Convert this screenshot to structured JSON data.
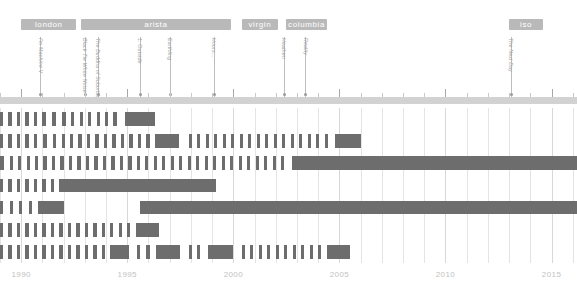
{
  "chart_data": {
    "type": "timeline",
    "title": "",
    "xlabel": "",
    "ylabel": "",
    "xlim": [
      1989.0,
      2016.2
    ],
    "grid": true,
    "axis": {
      "year_ticks": [
        1990,
        1995,
        2000,
        2005,
        2010,
        2015
      ],
      "minor_tick_step": 1,
      "tick_labels": [
        "1990",
        "1995",
        "2000",
        "2005",
        "2010",
        "2015"
      ]
    },
    "eras": [
      {
        "name": "london",
        "start": 1990.0,
        "end": 1992.6
      },
      {
        "name": "arista",
        "start": 1992.8,
        "end": 1999.9
      },
      {
        "name": "virgin",
        "start": 2000.4,
        "end": 2002.1
      },
      {
        "name": "columbia",
        "start": 2002.5,
        "end": 2004.4
      },
      {
        "name": "iso",
        "start": 2013.0,
        "end": 2014.6
      }
    ],
    "markers": [
      {
        "label": "I'm Machine V",
        "year": 1990.9,
        "elbow": false
      },
      {
        "label": "Black Tie White Noise",
        "year": 1993.0,
        "elbow": true
      },
      {
        "label": "The Buddha of Suburbia",
        "year": 1993.6,
        "elbow": true
      },
      {
        "label": "1. Outside",
        "year": 1995.6,
        "elbow": false
      },
      {
        "label": "Earthling",
        "year": 1997.0,
        "elbow": false
      },
      {
        "label": "Hours...",
        "year": 1999.1,
        "elbow": false
      },
      {
        "label": "Heathen",
        "year": 2002.4,
        "elbow": false
      },
      {
        "label": "Reality",
        "year": 2003.4,
        "elbow": false
      },
      {
        "label": "The Next Day",
        "year": 2013.1,
        "elbow": false
      }
    ],
    "rows": [
      {
        "name": "row-1",
        "title": "",
        "segments": [
          {
            "start": 1989.0,
            "end": 1989.15
          },
          {
            "start": 1989.4,
            "end": 1989.55
          },
          {
            "start": 1989.8,
            "end": 1989.95
          },
          {
            "start": 1990.2,
            "end": 1990.35
          },
          {
            "start": 1990.6,
            "end": 1990.75
          },
          {
            "start": 1991.0,
            "end": 1991.15
          },
          {
            "start": 1991.45,
            "end": 1991.62
          },
          {
            "start": 1991.9,
            "end": 1992.1
          },
          {
            "start": 1992.35,
            "end": 1992.5
          },
          {
            "start": 1992.75,
            "end": 1992.9
          },
          {
            "start": 1993.15,
            "end": 1993.3
          },
          {
            "start": 1993.55,
            "end": 1993.7
          },
          {
            "start": 1993.95,
            "end": 1994.1
          },
          {
            "start": 1994.35,
            "end": 1994.5
          },
          {
            "start": 1994.9,
            "end": 1996.3
          }
        ]
      },
      {
        "name": "row-2",
        "title": "",
        "segments": [
          {
            "start": 1989.0,
            "end": 1989.15
          },
          {
            "start": 1989.4,
            "end": 1989.55
          },
          {
            "start": 1989.8,
            "end": 1989.95
          },
          {
            "start": 1990.2,
            "end": 1990.35
          },
          {
            "start": 1990.6,
            "end": 1990.75
          },
          {
            "start": 1991.05,
            "end": 1991.2
          },
          {
            "start": 1991.5,
            "end": 1991.65
          },
          {
            "start": 1991.9,
            "end": 1992.05
          },
          {
            "start": 1992.3,
            "end": 1992.45
          },
          {
            "start": 1992.7,
            "end": 1992.85
          },
          {
            "start": 1993.1,
            "end": 1993.25
          },
          {
            "start": 1993.5,
            "end": 1993.65
          },
          {
            "start": 1993.9,
            "end": 1994.05
          },
          {
            "start": 1994.3,
            "end": 1994.45
          },
          {
            "start": 1994.7,
            "end": 1994.85
          },
          {
            "start": 1995.1,
            "end": 1995.25
          },
          {
            "start": 1995.5,
            "end": 1995.65
          },
          {
            "start": 1995.9,
            "end": 1996.05
          },
          {
            "start": 1996.3,
            "end": 1997.45
          },
          {
            "start": 1997.9,
            "end": 1998.05
          },
          {
            "start": 1998.3,
            "end": 1998.45
          },
          {
            "start": 1998.7,
            "end": 1998.85
          },
          {
            "start": 1999.1,
            "end": 1999.25
          },
          {
            "start": 1999.5,
            "end": 1999.65
          },
          {
            "start": 1999.9,
            "end": 2000.05
          },
          {
            "start": 2000.3,
            "end": 2000.45
          },
          {
            "start": 2000.7,
            "end": 2000.85
          },
          {
            "start": 2001.1,
            "end": 2001.25
          },
          {
            "start": 2001.5,
            "end": 2001.65
          },
          {
            "start": 2001.9,
            "end": 2002.05
          },
          {
            "start": 2002.3,
            "end": 2002.45
          },
          {
            "start": 2002.7,
            "end": 2002.85
          },
          {
            "start": 2003.1,
            "end": 2003.25
          },
          {
            "start": 2003.5,
            "end": 2003.65
          },
          {
            "start": 2003.9,
            "end": 2004.05
          },
          {
            "start": 2004.3,
            "end": 2004.45
          },
          {
            "start": 2004.8,
            "end": 2006.0
          }
        ]
      },
      {
        "name": "row-3",
        "title": "",
        "segments": [
          {
            "start": 1989.0,
            "end": 1989.2
          },
          {
            "start": 1989.45,
            "end": 1989.6
          },
          {
            "start": 1989.85,
            "end": 1990.0
          },
          {
            "start": 1990.25,
            "end": 1990.4
          },
          {
            "start": 1990.65,
            "end": 1990.8
          },
          {
            "start": 1991.05,
            "end": 1991.2
          },
          {
            "start": 1991.45,
            "end": 1991.6
          },
          {
            "start": 1991.85,
            "end": 1992.0
          },
          {
            "start": 1992.25,
            "end": 1992.4
          },
          {
            "start": 1992.65,
            "end": 1992.8
          },
          {
            "start": 1993.05,
            "end": 1993.2
          },
          {
            "start": 1993.45,
            "end": 1993.6
          },
          {
            "start": 1993.85,
            "end": 1994.0
          },
          {
            "start": 1994.25,
            "end": 1994.4
          },
          {
            "start": 1994.65,
            "end": 1994.8
          },
          {
            "start": 1995.05,
            "end": 1995.2
          },
          {
            "start": 1995.45,
            "end": 1995.6
          },
          {
            "start": 1995.85,
            "end": 1996.0
          },
          {
            "start": 1996.25,
            "end": 1996.4
          },
          {
            "start": 1996.65,
            "end": 1996.8
          },
          {
            "start": 1997.05,
            "end": 1997.2
          },
          {
            "start": 1997.45,
            "end": 1997.6
          },
          {
            "start": 1997.85,
            "end": 1998.0
          },
          {
            "start": 1998.25,
            "end": 1998.4
          },
          {
            "start": 1998.65,
            "end": 1998.8
          },
          {
            "start": 1999.05,
            "end": 1999.2
          },
          {
            "start": 1999.45,
            "end": 1999.6
          },
          {
            "start": 1999.85,
            "end": 2000.0
          },
          {
            "start": 2000.25,
            "end": 2000.4
          },
          {
            "start": 2000.65,
            "end": 2000.8
          },
          {
            "start": 2001.05,
            "end": 2001.2
          },
          {
            "start": 2001.45,
            "end": 2001.6
          },
          {
            "start": 2001.85,
            "end": 2002.0
          },
          {
            "start": 2002.25,
            "end": 2002.4
          },
          {
            "start": 2002.75,
            "end": 2016.2
          }
        ]
      },
      {
        "name": "row-4",
        "title": "",
        "segments": [
          {
            "start": 1989.0,
            "end": 1989.15
          },
          {
            "start": 1989.4,
            "end": 1989.55
          },
          {
            "start": 1989.8,
            "end": 1989.95
          },
          {
            "start": 1990.2,
            "end": 1990.35
          },
          {
            "start": 1990.6,
            "end": 1990.75
          },
          {
            "start": 1991.0,
            "end": 1991.15
          },
          {
            "start": 1991.4,
            "end": 1991.55
          },
          {
            "start": 1991.8,
            "end": 1999.2
          }
        ]
      },
      {
        "name": "row-5-dorsey",
        "title": "Dorsey",
        "segments": [
          {
            "start": 1989.0,
            "end": 1989.15
          },
          {
            "start": 1989.45,
            "end": 1989.6
          },
          {
            "start": 1989.9,
            "end": 1990.05
          },
          {
            "start": 1990.35,
            "end": 1990.5
          },
          {
            "start": 1990.8,
            "end": 1992.0
          },
          {
            "start": 1995.6,
            "end": 2016.2
          }
        ]
      },
      {
        "name": "row-6",
        "title": "",
        "segments": [
          {
            "start": 1989.0,
            "end": 1989.15
          },
          {
            "start": 1989.4,
            "end": 1989.55
          },
          {
            "start": 1989.8,
            "end": 1989.95
          },
          {
            "start": 1990.2,
            "end": 1990.35
          },
          {
            "start": 1990.6,
            "end": 1990.75
          },
          {
            "start": 1991.0,
            "end": 1991.15
          },
          {
            "start": 1991.4,
            "end": 1991.55
          },
          {
            "start": 1991.8,
            "end": 1991.95
          },
          {
            "start": 1992.2,
            "end": 1992.35
          },
          {
            "start": 1992.6,
            "end": 1992.75
          },
          {
            "start": 1993.0,
            "end": 1993.15
          },
          {
            "start": 1993.4,
            "end": 1993.55
          },
          {
            "start": 1993.8,
            "end": 1993.95
          },
          {
            "start": 1994.2,
            "end": 1994.35
          },
          {
            "start": 1994.6,
            "end": 1994.75
          },
          {
            "start": 1995.0,
            "end": 1995.15
          },
          {
            "start": 1995.4,
            "end": 1996.5
          }
        ]
      },
      {
        "name": "row-7",
        "title": "",
        "segments": [
          {
            "start": 1989.0,
            "end": 1989.15
          },
          {
            "start": 1989.4,
            "end": 1989.55
          },
          {
            "start": 1989.8,
            "end": 1989.95
          },
          {
            "start": 1990.2,
            "end": 1990.35
          },
          {
            "start": 1990.6,
            "end": 1990.75
          },
          {
            "start": 1991.0,
            "end": 1991.15
          },
          {
            "start": 1991.4,
            "end": 1991.55
          },
          {
            "start": 1991.8,
            "end": 1991.95
          },
          {
            "start": 1992.2,
            "end": 1992.35
          },
          {
            "start": 1992.6,
            "end": 1992.75
          },
          {
            "start": 1993.0,
            "end": 1993.15
          },
          {
            "start": 1993.4,
            "end": 1993.55
          },
          {
            "start": 1993.8,
            "end": 1993.95
          },
          {
            "start": 1994.2,
            "end": 1995.1
          },
          {
            "start": 1995.45,
            "end": 1995.6
          },
          {
            "start": 1995.9,
            "end": 1996.05
          },
          {
            "start": 1996.35,
            "end": 1997.5
          },
          {
            "start": 1997.9,
            "end": 1998.05
          },
          {
            "start": 1998.3,
            "end": 1998.45
          },
          {
            "start": 1998.8,
            "end": 2000.0
          },
          {
            "start": 2000.4,
            "end": 2000.55
          },
          {
            "start": 2000.8,
            "end": 2000.95
          },
          {
            "start": 2001.2,
            "end": 2001.35
          },
          {
            "start": 2001.6,
            "end": 2001.75
          },
          {
            "start": 2002.0,
            "end": 2002.15
          },
          {
            "start": 2002.4,
            "end": 2002.55
          },
          {
            "start": 2002.8,
            "end": 2002.95
          },
          {
            "start": 2003.2,
            "end": 2003.35
          },
          {
            "start": 2003.6,
            "end": 2003.75
          },
          {
            "start": 2004.0,
            "end": 2004.15
          },
          {
            "start": 2004.4,
            "end": 2005.5
          }
        ]
      }
    ],
    "colors": {
      "bar": "#6d6d6d",
      "era_band": "#b9b9b9",
      "era_text": "#ffffff",
      "marker_line": "#bdbdbd",
      "marker_text": "#9e9e9e",
      "axis_rail": "#d2d2d2",
      "year_text": "#c2c2c2",
      "gridline": "#e4e4e4",
      "row_title": "#2b2b2b",
      "background": "#ffffff"
    }
  }
}
